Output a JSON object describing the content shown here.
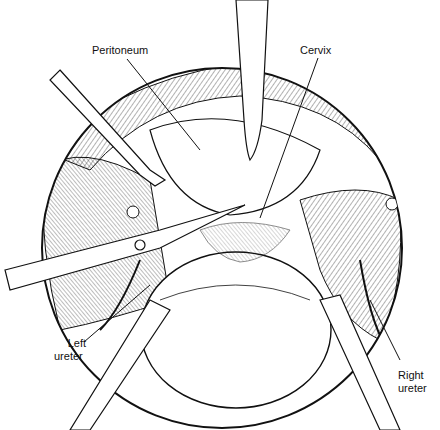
{
  "figure": {
    "type": "surgical-illustration",
    "labels": [
      {
        "id": "peritoneum",
        "text": "Peritoneum"
      },
      {
        "id": "cervix",
        "text": "Cervix"
      },
      {
        "id": "left-ureter-line1",
        "text": "Left"
      },
      {
        "id": "left-ureter-line2",
        "text": "ureter"
      },
      {
        "id": "right-ureter-line1",
        "text": "Right"
      },
      {
        "id": "right-ureter-line2",
        "text": "ureter"
      }
    ],
    "colors": {
      "ink": "#111111",
      "background": "#ffffff"
    }
  }
}
